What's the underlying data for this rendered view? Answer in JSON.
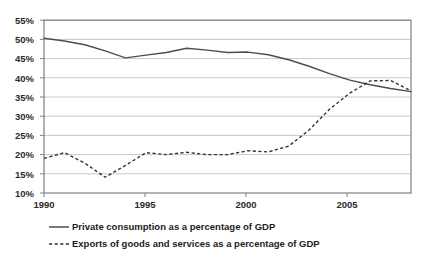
{
  "chart_data": {
    "type": "line",
    "title": "",
    "xlabel": "",
    "ylabel": "",
    "xlim": [
      1990,
      2008
    ],
    "ylim": [
      10,
      55
    ],
    "ytick_labels": [
      "55%",
      "50%",
      "45%",
      "40%",
      "35%",
      "30%",
      "25%",
      "20%",
      "15%",
      "10%"
    ],
    "ytick_values": [
      55,
      50,
      45,
      40,
      35,
      30,
      25,
      20,
      15,
      10
    ],
    "xtick_labels": [
      "1990",
      "1995",
      "2000",
      "2005"
    ],
    "xtick_values": [
      1990,
      1995,
      2000,
      2005
    ],
    "grid": "horizontal",
    "legend_position": "bottom-left",
    "x": [
      1990,
      1991,
      1992,
      1993,
      1994,
      1995,
      1996,
      1997,
      1998,
      1999,
      2000,
      2001,
      2002,
      2003,
      2004,
      2005,
      2006,
      2007,
      2008
    ],
    "series": [
      {
        "name": "Private consumption as a percentage of GDP",
        "style": "solid",
        "color": "#4d4d4d",
        "values": [
          50.3,
          49.6,
          48.6,
          47.0,
          45.2,
          45.9,
          46.6,
          47.7,
          47.2,
          46.6,
          46.7,
          46.0,
          44.7,
          43.0,
          41.1,
          39.4,
          38.2,
          37.2,
          36.4
        ]
      },
      {
        "name": "Exports of goods and services as a percentage of GDP",
        "style": "dashed",
        "color": "#333333",
        "values": [
          19.0,
          20.5,
          17.8,
          14.1,
          17.2,
          20.5,
          20.0,
          20.6,
          20.0,
          20.0,
          21.0,
          20.7,
          22.2,
          26.4,
          31.8,
          36.0,
          39.2,
          39.3,
          36.6
        ]
      }
    ]
  },
  "axis": {
    "ytick_labels": [
      "55%",
      "50%",
      "45%",
      "40%",
      "35%",
      "30%",
      "25%",
      "20%",
      "15%",
      "10%"
    ],
    "xtick_labels": [
      "1990",
      "1995",
      "2000",
      "2005"
    ]
  },
  "legend": {
    "items": [
      {
        "label": "Private consumption as a percentage of GDP",
        "style": "solid"
      },
      {
        "label": "Exports of goods and services as a percentage of GDP",
        "style": "dashed"
      }
    ]
  },
  "colors": {
    "series_solid": "#4d4d4d",
    "series_dashed": "#333333",
    "grid": "#c8c8c8",
    "frame": "#808080",
    "text": "#2b2b2b"
  }
}
